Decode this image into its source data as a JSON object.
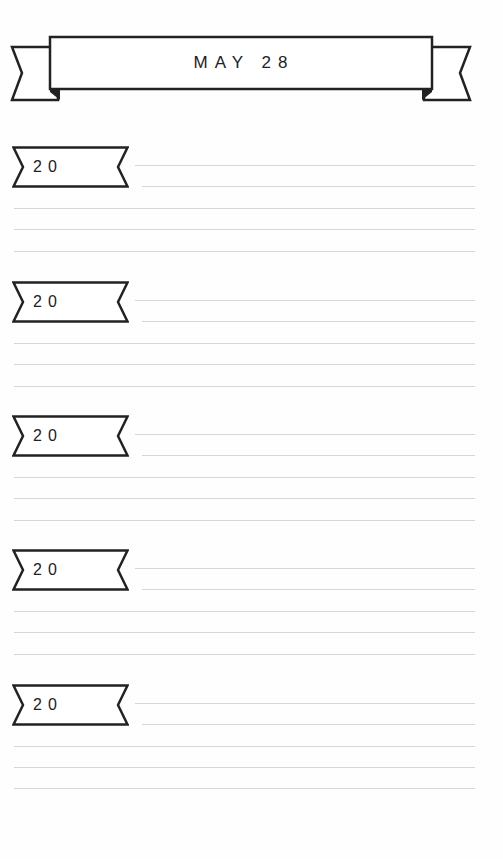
{
  "header": {
    "title": "MAY 28"
  },
  "entries": [
    {
      "year_prefix": "20",
      "line_count": 5
    },
    {
      "year_prefix": "20",
      "line_count": 5
    },
    {
      "year_prefix": "20",
      "line_count": 5
    },
    {
      "year_prefix": "20",
      "line_count": 5
    },
    {
      "year_prefix": "20",
      "line_count": 5
    }
  ],
  "colors": {
    "ink": "#222222",
    "rule": "#d6d6d6",
    "paper": "#fefefe"
  }
}
